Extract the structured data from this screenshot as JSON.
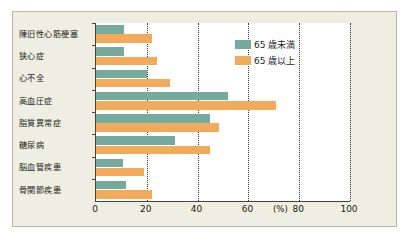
{
  "chart_data": {
    "type": "bar",
    "orientation": "horizontal",
    "title": "",
    "xlabel": "(%)",
    "ylabel": "",
    "xlim": [
      0,
      100
    ],
    "xticks": [
      "0",
      "20",
      "40",
      "60",
      "80",
      "100"
    ],
    "unit": "(%)",
    "grid": "vertical dotted gridlines at 20, 40, 60, 80, 100",
    "legend_position": "top-right inside plot",
    "categories": [
      "陳旧性心筋梗塞",
      "狭心症",
      "心不全",
      "高血圧症",
      "脂質異常症",
      "糖尿病",
      "脳血管疾患",
      "骨関節疾患"
    ],
    "series": [
      {
        "name": "65 歳未満",
        "color": "#74ab9e",
        "values": [
          11,
          11,
          20,
          52,
          45,
          31,
          10.5,
          12
        ]
      },
      {
        "name": "65 歳以上",
        "color": "#f2ab5d",
        "values": [
          22,
          24,
          29,
          71,
          48.5,
          45,
          19,
          22
        ]
      }
    ]
  },
  "colors": {
    "under65": "#74ab9e",
    "over65": "#f2ab5d",
    "figure_background": "#efeee2",
    "plot_background": "#ffffff",
    "axis": "#4c4438",
    "border": "#b9b7a4"
  }
}
